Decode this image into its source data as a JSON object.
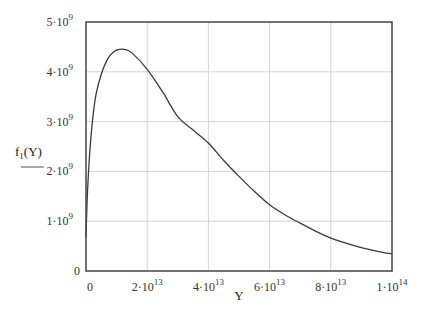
{
  "chart_data": {
    "type": "line",
    "title": "",
    "xlabel": "Y",
    "ylabel": "f_1(Y)",
    "ylabel_main": "f",
    "ylabel_sub": "1",
    "ylabel_arg": "(Y)",
    "xlim": [
      0,
      100000000000000.0
    ],
    "ylim": [
      0,
      5000000000.0
    ],
    "grid": true,
    "legend": "none",
    "x_ticks": [
      {
        "value": 0,
        "base": "0",
        "exp": ""
      },
      {
        "value": 20000000000000.0,
        "base": "2·10",
        "exp": "13"
      },
      {
        "value": 40000000000000.0,
        "base": "4·10",
        "exp": "13"
      },
      {
        "value": 60000000000000.0,
        "base": "6·10",
        "exp": "13"
      },
      {
        "value": 80000000000000.0,
        "base": "8·10",
        "exp": "13"
      },
      {
        "value": 100000000000000.0,
        "base": "1·10",
        "exp": "14"
      }
    ],
    "y_ticks": [
      {
        "value": 0,
        "base": "0",
        "exp": ""
      },
      {
        "value": 1000000000.0,
        "base": "1·10",
        "exp": "9"
      },
      {
        "value": 2000000000.0,
        "base": "2·10",
        "exp": "9"
      },
      {
        "value": 3000000000.0,
        "base": "3·10",
        "exp": "9"
      },
      {
        "value": 4000000000.0,
        "base": "4·10",
        "exp": "9"
      },
      {
        "value": 5000000000.0,
        "base": "5·10",
        "exp": "9"
      }
    ],
    "series": [
      {
        "name": "f1(Y)",
        "color": "#3a3a3a",
        "x": [
          0,
          500000000000.0,
          1500000000000.0,
          3000000000000.0,
          5000000000000.0,
          7000000000000.0,
          9000000000000.0,
          11000000000000.0,
          12500000000000.0,
          15000000000000.0,
          20000000000000.0,
          25000000000000.0,
          30000000000000.0,
          35000000000000.0,
          40000000000000.0,
          45000000000000.0,
          50000000000000.0,
          55000000000000.0,
          60000000000000.0,
          65000000000000.0,
          70000000000000.0,
          75000000000000.0,
          80000000000000.0,
          85000000000000.0,
          90000000000000.0,
          95000000000000.0,
          100000000000000.0
        ],
        "values": [
          680000000.0,
          1600000000.0,
          2600000000.0,
          3450000000.0,
          3950000000.0,
          4250000000.0,
          4400000000.0,
          4450000000.0,
          4450000000.0,
          4380000000.0,
          4050000000.0,
          3600000000.0,
          3100000000.0,
          2830000000.0,
          2570000000.0,
          2220000000.0,
          1900000000.0,
          1600000000.0,
          1330000000.0,
          1130000000.0,
          960000000.0,
          800000000.0,
          660000000.0,
          560000000.0,
          470000000.0,
          400000000.0,
          340000000.0
        ]
      }
    ]
  },
  "colors": {
    "axis": "#444444",
    "grid": "#d4d4d4",
    "curve": "#3a3a3a"
  }
}
